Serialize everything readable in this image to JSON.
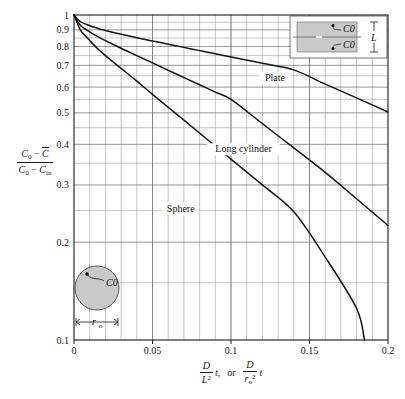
{
  "figure": {
    "caption": ""
  },
  "axes": {
    "y_label_numerator": "C0 − C̄",
    "y_label_denominator": "C0 − Cin",
    "y_label_plain": "(C0 − C̄) / (C0 − Cin)",
    "x_label_plain": "D/L² t,  or  D/rₒ² t",
    "x_label_part1_num": "D",
    "x_label_part1_den": "L",
    "x_label_part1_den_exp": "2",
    "x_label_part1_tail": "t,",
    "x_label_or": "or",
    "x_label_part2_num": "D",
    "x_label_part2_den": "r",
    "x_label_part2_den_sub": "o",
    "x_label_part2_den_exp": "2",
    "x_label_part2_tail": "t",
    "y_ticks": [
      "1",
      "0.9",
      "0.8",
      "0.7",
      "0.6",
      "0.5",
      "0.4",
      "0.3",
      "0.2",
      "0.1"
    ],
    "x_ticks": [
      "0",
      "0.05",
      "0.1",
      "0.15",
      "0.2"
    ]
  },
  "insets": {
    "plate": {
      "name": "plate-geometry-inset",
      "label_top": "C0",
      "label_bottom": "C0",
      "dimension_label": "L"
    },
    "sphere": {
      "name": "sphere-geometry-inset",
      "label": "C0",
      "dimension_label": "r",
      "dimension_sub": "o"
    }
  },
  "chart_data": {
    "type": "line",
    "title": "",
    "xlabel": "D/L² t,  or  D/rₒ² t",
    "ylabel": "(C0 − C̄)/(C0 − Cin)",
    "xlim": [
      0,
      0.2
    ],
    "ylim": [
      0.1,
      1
    ],
    "yscale": "log",
    "xscale": "linear",
    "grid": true,
    "x_major_ticks": [
      0,
      0.05,
      0.1,
      0.15,
      0.2
    ],
    "x_minor_step": 0.01,
    "y_major_ticks": [
      0.1,
      0.2,
      0.3,
      0.4,
      0.5,
      0.6,
      0.7,
      0.8,
      0.9,
      1.0
    ],
    "y_minor_ticks": [
      0.15,
      0.25,
      0.35,
      0.45,
      0.55,
      0.65,
      0.75,
      0.85,
      0.95
    ],
    "legend_position": "inline-labels",
    "series": [
      {
        "name": "Plate",
        "label": "Plate",
        "label_x": 0.128,
        "label_y": 0.625,
        "x": [
          0.0,
          0.004,
          0.008,
          0.012,
          0.016,
          0.02,
          0.03,
          0.04,
          0.05,
          0.06,
          0.07,
          0.08,
          0.09,
          0.1,
          0.12,
          0.14,
          0.16,
          0.18,
          0.2
        ],
        "y": [
          1.0,
          0.955,
          0.935,
          0.92,
          0.907,
          0.896,
          0.872,
          0.851,
          0.832,
          0.813,
          0.795,
          0.777,
          0.76,
          0.743,
          0.71,
          0.678,
          0.613,
          0.556,
          0.503
        ]
      },
      {
        "name": "Long cylinder",
        "label": "Long cylinder",
        "label_x": 0.108,
        "label_y": 0.378,
        "x": [
          0.0,
          0.004,
          0.008,
          0.012,
          0.016,
          0.02,
          0.03,
          0.04,
          0.05,
          0.06,
          0.07,
          0.08,
          0.09,
          0.1,
          0.12,
          0.14,
          0.16,
          0.18,
          0.2
        ],
        "y": [
          1.0,
          0.93,
          0.9,
          0.875,
          0.853,
          0.834,
          0.79,
          0.75,
          0.712,
          0.676,
          0.642,
          0.61,
          0.579,
          0.55,
          0.463,
          0.39,
          0.328,
          0.272,
          0.225
        ]
      },
      {
        "name": "Sphere",
        "label": "Sphere",
        "label_x": 0.068,
        "label_y": 0.247,
        "x": [
          0.0,
          0.004,
          0.008,
          0.012,
          0.016,
          0.02,
          0.03,
          0.04,
          0.05,
          0.06,
          0.07,
          0.08,
          0.09,
          0.1,
          0.12,
          0.14,
          0.16,
          0.18,
          0.185
        ],
        "y": [
          1.0,
          0.9,
          0.855,
          0.815,
          0.78,
          0.75,
          0.685,
          0.626,
          0.57,
          0.52,
          0.475,
          0.433,
          0.395,
          0.36,
          0.3,
          0.248,
          0.18,
          0.125,
          0.1
        ]
      }
    ]
  },
  "colors": {
    "curve": "#141414",
    "grid_minor": "#8d8d8d",
    "grid_major": "#6b6b6b",
    "frame": "#1a1a1a",
    "inset_fill": "#c9c9c9",
    "background": "#ffffff"
  }
}
